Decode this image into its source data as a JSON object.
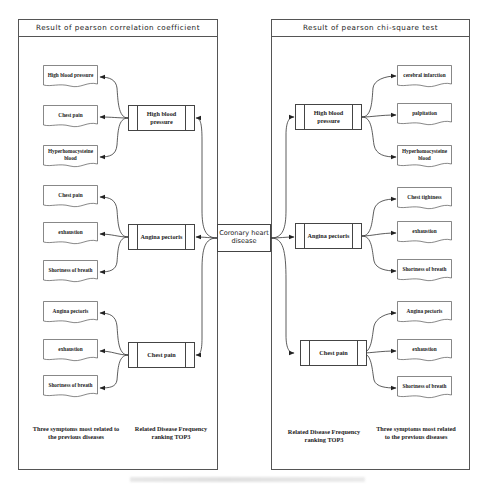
{
  "left_panel": {
    "title": "Result of pearson correlation coefficient",
    "footer": {
      "symptoms_label": "Three symptoms most related to the previous diseases",
      "ranking_label": "Related Disease Frequency ranking TOP3"
    },
    "diseases": [
      {
        "label": "High blood pressure",
        "symptoms": [
          "High blood pressure",
          "Chest pain",
          "Hyperhomocysteine blood"
        ]
      },
      {
        "label": "Angina pectoris",
        "symptoms": [
          "Chest pain",
          "exhaustion",
          "Shortness of breath"
        ]
      },
      {
        "label": "Chest pain",
        "symptoms": [
          "Angina pectoris",
          "exhaustion",
          "Shortness of breath"
        ]
      }
    ]
  },
  "center": {
    "label": "Coronary heart disease"
  },
  "right_panel": {
    "title": "Result of pearson chi-square test",
    "footer": {
      "ranking_label": "Related Disease Frequency ranking TOP3",
      "symptoms_label": "Three symptoms most related to the previous diseases"
    },
    "diseases": [
      {
        "label": "High blood pressure",
        "symptoms": [
          "cerebral infarction",
          "palpitation",
          "Hyperhomocysteine blood"
        ]
      },
      {
        "label": "Angina pectoris",
        "symptoms": [
          "Chest tightness",
          "exhaustion",
          "Shortness of breath"
        ]
      },
      {
        "label": "Chest pain",
        "symptoms": [
          "Angina pectoris",
          "exhaustion",
          "Shortness of breath"
        ]
      }
    ]
  },
  "colors": {
    "line": "#333333",
    "border": "#555555",
    "background": "#ffffff"
  }
}
